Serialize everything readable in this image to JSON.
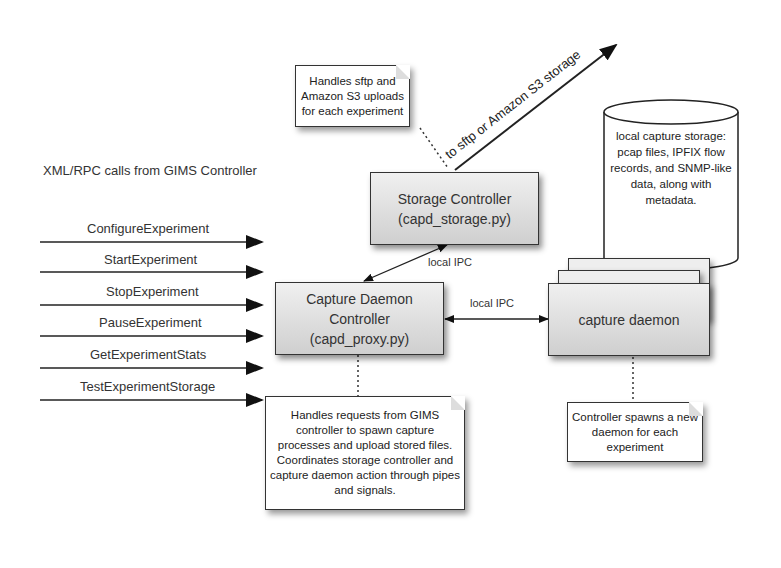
{
  "diagram": {
    "rpc_title": "XML/RPC calls from GIMS Controller",
    "rpc_calls": [
      "ConfigureExperiment",
      "StartExperiment",
      "StopExperiment",
      "PauseExperiment",
      "GetExperimentStats",
      "TestExperimentStorage"
    ],
    "storage_controller": {
      "line1": "Storage Controller",
      "line2": "(capd_storage.py)"
    },
    "capture_controller": {
      "line1": "Capture Daemon",
      "line2": "Controller",
      "line3": "(capd_proxy.py)"
    },
    "capture_daemon": "capture daemon",
    "ipc_label_storage": "local IPC",
    "ipc_label_daemon": "local IPC",
    "upload_arrow_label": "to sftp or Amazon S3 storage",
    "note_storage": "Handles sftp and Amazon S3 uploads for each experiment",
    "note_controller": "Handles requests from GIMS controller to spawn capture processes and upload stored files.  Coordinates storage controller and capture daemon action through pipes and signals.",
    "note_daemon": "Controller spawns a new daemon for each experiment",
    "cylinder": "local capture storage: pcap files, IPFIX flow records, and SNMP-like data, along with metadata."
  }
}
